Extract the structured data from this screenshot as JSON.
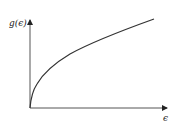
{
  "diagram": {
    "y_axis_label": "g(ϵ)",
    "x_axis_label": "ϵ",
    "curve": "g(ϵ) ∝ √ϵ",
    "colors": {
      "axis": "#555555",
      "curve": "#333333",
      "text": "#222222"
    }
  }
}
